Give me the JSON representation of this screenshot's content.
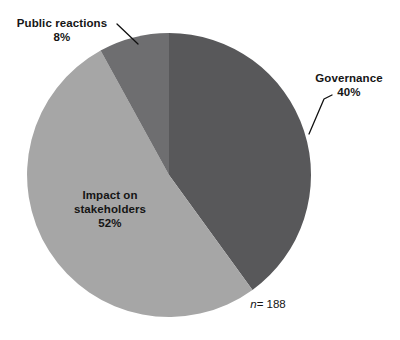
{
  "chart_data": {
    "type": "pie",
    "title": "",
    "subtitle": "",
    "xlabel": "",
    "ylabel": "",
    "legend_position": "none",
    "grid": false,
    "sample_size_note": "n = 188",
    "sample_size_symbol": "n",
    "sample_size_value": "= 188",
    "total_n": 188,
    "start_angle_deg": 0,
    "direction": "clockwise",
    "categories": [
      "Governance",
      "Impact on stakeholders",
      "Public reactions"
    ],
    "values": [
      40,
      52,
      8
    ],
    "value_unit": "percent",
    "slices": [
      {
        "label": "Governance",
        "label_line1": "Governance",
        "value": 40,
        "value_text": "40%",
        "color": "#58585a",
        "label_placement": "outside-callout",
        "leader_line": true
      },
      {
        "label": "Impact on stakeholders",
        "label_line1": "Impact on",
        "label_line2": "stakeholders",
        "value": 52,
        "value_text": "52%",
        "color": "#a6a6a6",
        "label_placement": "inside",
        "leader_line": false
      },
      {
        "label": "Public reactions",
        "label_line1": "Public reactions",
        "value": 8,
        "value_text": "8%",
        "color": "#6e6e70",
        "label_placement": "outside-callout",
        "leader_line": true
      }
    ],
    "geometry": {
      "center_x": 169,
      "center_y": 175,
      "radius": 142
    }
  },
  "colors": {
    "background": "#ffffff",
    "text": "#151515",
    "leader_line": "#101010",
    "slice_governance": "#58585a",
    "slice_impact": "#a6a6a6",
    "slice_public": "#6e6e70"
  }
}
